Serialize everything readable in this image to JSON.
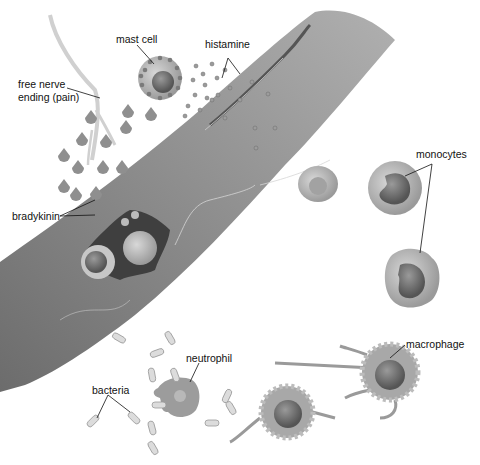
{
  "diagram": {
    "labels": {
      "mast_cell": "mast cell",
      "histamine": "histamine",
      "free_nerve_ending_line1": "free nerve",
      "free_nerve_ending_line2": "ending (pain)",
      "bradykinin": "bradykinin",
      "monocytes": "monocytes",
      "neutrophil": "neutrophil",
      "bacteria": "bacteria",
      "macrophage": "macrophage"
    },
    "colors": {
      "vessel": "#8a8a8a",
      "vessel_dark": "#5e5e5e",
      "cell_fill": "#b5b5b5",
      "nucleus": "#6b6b6b",
      "granule": "#8e8e8e",
      "background": "#ffffff",
      "text": "#111111"
    }
  }
}
